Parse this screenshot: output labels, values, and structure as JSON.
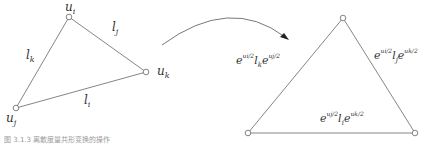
{
  "left_triangle": {
    "vertices": {
      "ui": {
        "label": "u",
        "sub": "i"
      },
      "uj": {
        "label": "u",
        "sub": "j"
      },
      "uk": {
        "label": "u",
        "sub": "k"
      }
    },
    "edges": {
      "lk": {
        "label": "l",
        "sub": "k"
      },
      "lj": {
        "label": "l",
        "sub": "j"
      },
      "li": {
        "label": "l",
        "sub": "i"
      }
    }
  },
  "right_triangle": {
    "edges": {
      "left": {
        "e1": "e",
        "f1": "ui/2",
        "l": "l",
        "sub": "k",
        "e2": "e",
        "f2": "uj/2"
      },
      "right": {
        "e1": "e",
        "f1": "ui/2",
        "l": "l",
        "sub": "j",
        "e2": "e",
        "f2": "uk/2"
      },
      "bottom": {
        "e1": "e",
        "f1": "uj/2",
        "l": "l",
        "sub": "i",
        "e2": "e",
        "f2": "uk/2"
      }
    }
  },
  "caption": "图 3.1.3 离散度量共形变换的操作",
  "colors": {
    "line": "#666666",
    "text": "#333333"
  }
}
